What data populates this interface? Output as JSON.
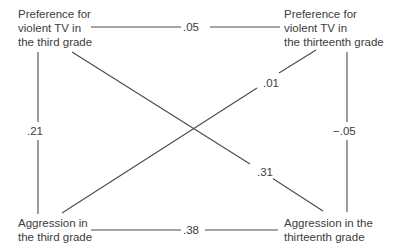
{
  "diagram": {
    "type": "cross-lagged panel correlation",
    "nodes": {
      "tv_third": {
        "lines": [
          "Preference for",
          "violent TV in",
          "the third grade"
        ]
      },
      "tv_thirteenth": {
        "lines": [
          "Preference for",
          "violent TV in",
          "the thirteenth grade"
        ]
      },
      "aggr_third": {
        "lines": [
          "Aggression in",
          "the third grade"
        ]
      },
      "aggr_thirteenth": {
        "lines": [
          "Aggression in the",
          "thirteenth grade"
        ]
      }
    },
    "edges": [
      {
        "from": "tv_third",
        "to": "tv_thirteenth",
        "label": ".05"
      },
      {
        "from": "aggr_third",
        "to": "aggr_thirteenth",
        "label": ".38"
      },
      {
        "from": "tv_third",
        "to": "aggr_third",
        "label": ".21"
      },
      {
        "from": "tv_thirteenth",
        "to": "aggr_thirteenth",
        "label": "−.05"
      },
      {
        "from": "aggr_third",
        "to": "tv_thirteenth",
        "label": ".01"
      },
      {
        "from": "tv_third",
        "to": "aggr_thirteenth",
        "label": ".31"
      }
    ],
    "colors": {
      "line": "#4a4a4a",
      "text": "#3c3c3c",
      "background": "#ffffff"
    }
  }
}
